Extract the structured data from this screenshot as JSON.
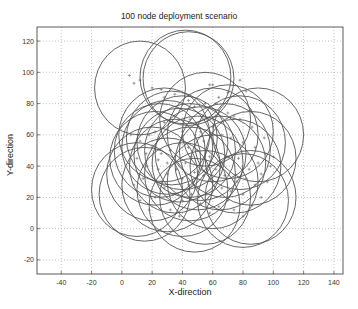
{
  "chart_data": {
    "type": "scatter",
    "title": "100 node deployment scenario",
    "xlabel": "X-direction",
    "ylabel": "Y-direction",
    "xlim": [
      -56,
      146
    ],
    "ylim": [
      -29,
      129
    ],
    "xticks": [
      -40,
      -20,
      0,
      20,
      40,
      60,
      80,
      100,
      120,
      140
    ],
    "yticks": [
      -20,
      0,
      20,
      40,
      60,
      80,
      100,
      120
    ],
    "grid": true,
    "legend": null,
    "range_radius": 30,
    "series": [
      {
        "name": "nodes",
        "marker": "+",
        "points": [
          [
            5,
            98
          ],
          [
            12,
            95
          ],
          [
            8,
            93
          ],
          [
            20,
            90
          ],
          [
            26,
            89
          ],
          [
            28,
            84
          ],
          [
            35,
            86
          ],
          [
            44,
            82
          ],
          [
            48,
            78
          ],
          [
            58,
            92
          ],
          [
            60,
            92
          ],
          [
            55,
            80
          ],
          [
            64,
            84
          ],
          [
            78,
            95
          ],
          [
            82,
            88
          ],
          [
            70,
            87
          ],
          [
            85,
            76
          ],
          [
            74,
            72
          ],
          [
            62,
            80
          ],
          [
            45,
            70
          ],
          [
            35,
            72
          ],
          [
            28,
            68
          ],
          [
            22,
            62
          ],
          [
            18,
            60
          ],
          [
            40,
            62
          ],
          [
            52,
            62
          ],
          [
            60,
            65
          ],
          [
            66,
            60
          ],
          [
            72,
            58
          ],
          [
            80,
            55
          ],
          [
            88,
            52
          ],
          [
            95,
            48
          ],
          [
            90,
            42
          ],
          [
            84,
            38
          ],
          [
            77,
            45
          ],
          [
            70,
            46
          ],
          [
            65,
            40
          ],
          [
            58,
            46
          ],
          [
            50,
            50
          ],
          [
            44,
            52
          ],
          [
            38,
            55
          ],
          [
            32,
            50
          ],
          [
            26,
            48
          ],
          [
            20,
            52
          ],
          [
            12,
            56
          ],
          [
            6,
            60
          ],
          [
            10,
            45
          ],
          [
            16,
            40
          ],
          [
            24,
            38
          ],
          [
            30,
            42
          ],
          [
            36,
            38
          ],
          [
            42,
            42
          ],
          [
            48,
            36
          ],
          [
            54,
            34
          ],
          [
            60,
            30
          ],
          [
            66,
            26
          ],
          [
            72,
            24
          ],
          [
            80,
            22
          ],
          [
            88,
            28
          ],
          [
            92,
            35
          ],
          [
            96,
            30
          ],
          [
            82,
            32
          ],
          [
            76,
            30
          ],
          [
            70,
            18
          ],
          [
            64,
            14
          ],
          [
            58,
            10
          ],
          [
            52,
            16
          ],
          [
            46,
            22
          ],
          [
            40,
            18
          ],
          [
            34,
            22
          ],
          [
            28,
            26
          ],
          [
            22,
            20
          ],
          [
            18,
            12
          ],
          [
            12,
            18
          ],
          [
            8,
            28
          ],
          [
            14,
            32
          ],
          [
            26,
            30
          ],
          [
            32,
            12
          ],
          [
            38,
            8
          ],
          [
            44,
            28
          ],
          [
            50,
            26
          ],
          [
            56,
            22
          ],
          [
            62,
            38
          ],
          [
            68,
            34
          ],
          [
            74,
            12
          ],
          [
            80,
            8
          ],
          [
            86,
            15
          ],
          [
            92,
            20
          ],
          [
            98,
            40
          ],
          [
            100,
            46
          ],
          [
            94,
            58
          ],
          [
            86,
            65
          ],
          [
            78,
            70
          ],
          [
            70,
            74
          ],
          [
            62,
            72
          ],
          [
            54,
            56
          ],
          [
            46,
            46
          ],
          [
            40,
            32
          ],
          [
            30,
            35
          ],
          [
            24,
            44
          ],
          [
            16,
            48
          ]
        ]
      }
    ],
    "circles": [
      [
        12,
        90
      ],
      [
        42,
        97
      ],
      [
        44,
        96
      ],
      [
        55,
        70
      ],
      [
        28,
        60
      ],
      [
        30,
        52
      ],
      [
        40,
        55
      ],
      [
        45,
        50
      ],
      [
        25,
        50
      ],
      [
        60,
        60
      ],
      [
        70,
        62
      ],
      [
        78,
        55
      ],
      [
        90,
        60
      ],
      [
        85,
        45
      ],
      [
        75,
        40
      ],
      [
        50,
        42
      ],
      [
        35,
        40
      ],
      [
        20,
        35
      ],
      [
        10,
        25
      ],
      [
        15,
        22
      ],
      [
        40,
        25
      ],
      [
        48,
        15
      ],
      [
        55,
        20
      ],
      [
        80,
        18
      ],
      [
        85,
        20
      ],
      [
        60,
        30
      ],
      [
        65,
        42
      ],
      [
        30,
        28
      ],
      [
        22,
        45
      ],
      [
        38,
        47
      ],
      [
        33,
        58
      ],
      [
        52,
        48
      ],
      [
        68,
        50
      ],
      [
        45,
        35
      ]
    ]
  }
}
